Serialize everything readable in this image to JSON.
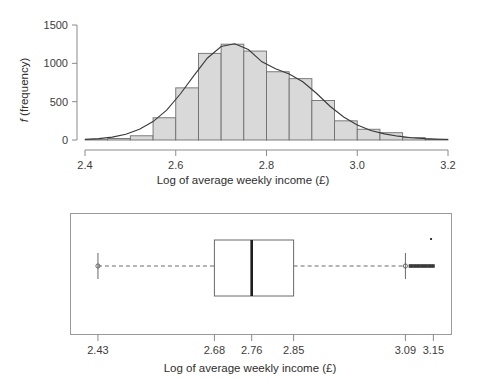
{
  "chart_data": [
    {
      "type": "bar",
      "name": "histogram-of-log-weekly-income",
      "title": "",
      "xlabel": "Log of average weekly income (£)",
      "ylabel": "f (frequency)",
      "ylabel_italic_prefix": "f",
      "ylabel_rest": " (frequency)",
      "xlim": [
        2.4,
        3.2
      ],
      "ylim": [
        0,
        1500
      ],
      "xticks": [
        2.4,
        2.6,
        2.8,
        3.0,
        3.2
      ],
      "xtick_labels": [
        "2.4",
        "2.6",
        "2.8",
        "3.0",
        "3.2"
      ],
      "yticks": [
        0,
        500,
        1000,
        1500
      ],
      "ytick_labels": [
        "0",
        "500",
        "1000",
        "1500"
      ],
      "grid": false,
      "legend": "none",
      "bin_width": 0.05,
      "bin_edges": [
        2.4,
        2.45,
        2.5,
        2.55,
        2.6,
        2.65,
        2.7,
        2.75,
        2.8,
        2.85,
        2.9,
        2.95,
        3.0,
        3.05,
        3.1,
        3.15,
        3.2
      ],
      "categories": [
        "2.40-2.45",
        "2.45-2.50",
        "2.50-2.55",
        "2.55-2.60",
        "2.60-2.65",
        "2.65-2.70",
        "2.70-2.75",
        "2.75-2.80",
        "2.80-2.85",
        "2.85-2.90",
        "2.90-2.95",
        "2.95-3.00",
        "3.00-3.05",
        "3.05-3.10",
        "3.10-3.15",
        "3.15-3.20"
      ],
      "values": [
        5,
        20,
        55,
        290,
        680,
        1130,
        1250,
        1160,
        890,
        800,
        515,
        250,
        140,
        95,
        30,
        10
      ],
      "bar_fill": "#d9d9d9",
      "bar_stroke": "#6f6f6f",
      "overlay_curve": {
        "name": "normal-density-curve",
        "stroke": "#3a3a3a",
        "x": [
          2.4,
          2.43,
          2.46,
          2.49,
          2.52,
          2.55,
          2.58,
          2.61,
          2.64,
          2.67,
          2.7,
          2.73,
          2.76,
          2.79,
          2.82,
          2.85,
          2.88,
          2.91,
          2.94,
          2.97,
          3.0,
          3.03,
          3.06,
          3.09,
          3.12,
          3.15,
          3.18,
          3.2
        ],
        "y": [
          8,
          18,
          38,
          75,
          140,
          240,
          390,
          600,
          840,
          1070,
          1220,
          1255,
          1180,
          1020,
          930,
          860,
          760,
          610,
          440,
          300,
          195,
          125,
          80,
          50,
          30,
          18,
          10,
          7
        ]
      }
    },
    {
      "type": "boxplot",
      "name": "boxplot-of-log-weekly-income",
      "title": "",
      "xlabel": "Log of average weekly income (£)",
      "ylabel": "",
      "orientation": "horizontal",
      "xlim": [
        2.37,
        3.19
      ],
      "xticks": [
        2.43,
        2.68,
        2.76,
        2.85,
        3.09,
        3.15
      ],
      "xtick_labels": [
        "2.43",
        "2.68",
        "2.76",
        "2.85",
        "3.09",
        "3.15"
      ],
      "grid": false,
      "legend": "none",
      "stats": {
        "lower_whisker": 2.43,
        "q1": 2.68,
        "median": 2.76,
        "q3": 2.85,
        "upper_whisker": 3.09,
        "max_outlier": 3.15
      },
      "outliers_low": [
        2.43
      ],
      "outliers_high": [
        3.09,
        3.1,
        3.105,
        3.11,
        3.115,
        3.12,
        3.125,
        3.13,
        3.135,
        3.14,
        3.145,
        3.15
      ],
      "extreme_outlier": 3.145
    }
  ],
  "figure": {
    "background": "#ffffff",
    "text_color": "#3a3a3a"
  }
}
